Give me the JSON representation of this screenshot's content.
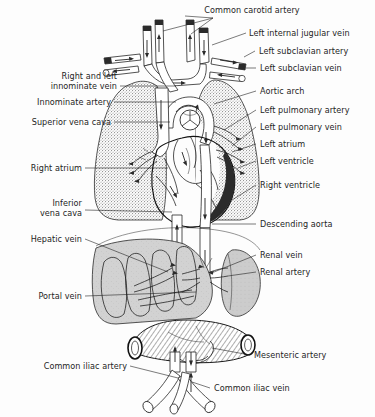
{
  "figure": {
    "background_color": "#fdfdfd",
    "ink_color": "#1a1a1a",
    "label_color": "#1d1d1d",
    "organ_colors": {
      "lung_stipple": "#9a9a9a",
      "liver": "#c9c9c9",
      "kidney": "#c4c4c4",
      "heart_wall_dark": "#2b2b2b",
      "vessel_lumen": "#ffffff"
    }
  },
  "labels": {
    "common_carotid_artery": "Common carotid artery",
    "left_internal_jugular_vein": "Left internal jugular vein",
    "left_subclavian_artery": "Left subclavian artery",
    "left_subclavian_vein": "Left subclavian vein",
    "right_and_left_innominate_vein_1": "Right and left",
    "right_and_left_innominate_vein_2": "innominate vein",
    "innominate_artery": "Innominate artery",
    "superior_vena_cava": "Superior vena cava",
    "aortic_arch": "Aortic arch",
    "left_pulmonary_artery": "Left pulmonary artery",
    "left_pulmonary_vein": "Left pulmonary vein",
    "left_atrium": "Left atrium",
    "left_ventricle": "Left ventricle",
    "right_atrium": "Right atrium",
    "right_ventricle": "Right ventricle",
    "inferior_vena_cava_1": "Inferior",
    "inferior_vena_cava_2": "vena cava",
    "descending_aorta": "Descending aorta",
    "hepatic_vein": "Hepatic vein",
    "renal_vein": "Renal vein",
    "renal_artery": "Renal artery",
    "portal_vein": "Portal vein",
    "mesenteric_artery": "Mesenteric artery",
    "common_iliac_artery": "Common iliac artery",
    "common_iliac_vein": "Common iliac vein"
  },
  "anatomy_parts": [
    "right-lung",
    "left-lung",
    "heart",
    "aortic-arch",
    "descending-aorta",
    "superior-vena-cava",
    "inferior-vena-cava",
    "liver",
    "kidney",
    "intestine",
    "iliac-vessels",
    "carotid-arteries",
    "jugular-veins",
    "subclavian-vessels",
    "innominate-vessels",
    "pulmonary-vessels"
  ]
}
